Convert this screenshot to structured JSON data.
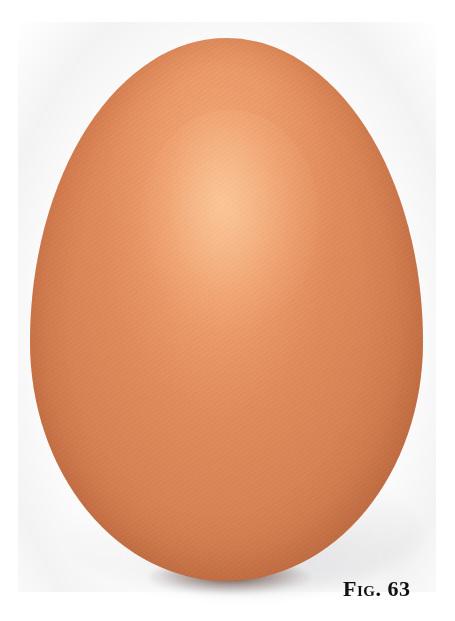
{
  "figure": {
    "caption": "Fig. 63",
    "colors": {
      "egg_light": "#f7b98a",
      "egg_mid": "#d88355",
      "egg_dark": "#b8653f",
      "background": "#ffffff",
      "caption_text": "#111111"
    }
  }
}
